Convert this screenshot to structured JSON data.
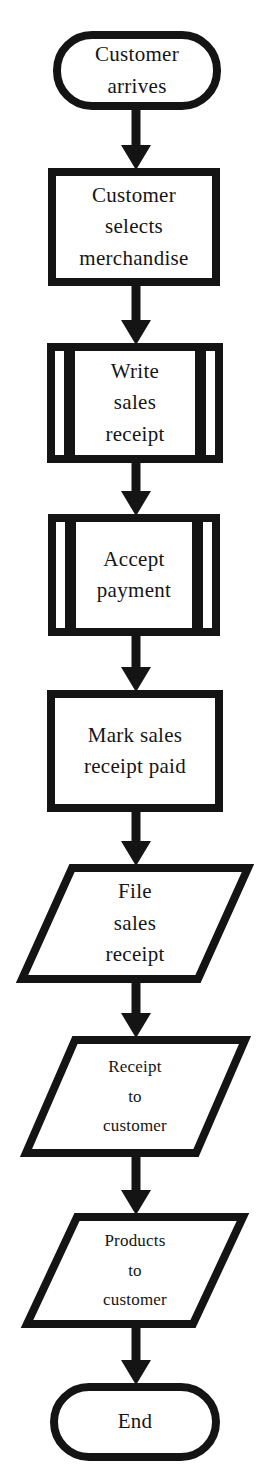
{
  "diagram": {
    "type": "flowchart",
    "orientation": "top-to-bottom",
    "colors": {
      "ink": "#141414",
      "paper": "#ffffff",
      "text": "#151515"
    },
    "nodes": [
      {
        "id": "start",
        "type": "terminal",
        "label": "Customer\narrives"
      },
      {
        "id": "select-merchandise",
        "type": "process",
        "label": "Customer\nselects\nmerchandise"
      },
      {
        "id": "write-sales-receipt",
        "type": "predefined-process",
        "label": "Write\nsales\nreceipt"
      },
      {
        "id": "accept-payment",
        "type": "predefined-process",
        "label": "Accept\npayment"
      },
      {
        "id": "mark-receipt-paid",
        "type": "process",
        "label": "Mark sales\nreceipt paid"
      },
      {
        "id": "file-sales-receipt",
        "type": "input-output",
        "label": "File\nsales\nreceipt"
      },
      {
        "id": "receipt-to-customer",
        "type": "input-output",
        "label": "Receipt\nto\ncustomer"
      },
      {
        "id": "products-to-customer",
        "type": "input-output",
        "label": "Products\nto\ncustomer"
      },
      {
        "id": "end",
        "type": "terminal",
        "label": "End"
      }
    ],
    "edges": [
      {
        "from": "start",
        "to": "select-merchandise"
      },
      {
        "from": "select-merchandise",
        "to": "write-sales-receipt"
      },
      {
        "from": "write-sales-receipt",
        "to": "accept-payment"
      },
      {
        "from": "accept-payment",
        "to": "mark-receipt-paid"
      },
      {
        "from": "mark-receipt-paid",
        "to": "file-sales-receipt"
      },
      {
        "from": "file-sales-receipt",
        "to": "receipt-to-customer"
      },
      {
        "from": "receipt-to-customer",
        "to": "products-to-customer"
      },
      {
        "from": "products-to-customer",
        "to": "end"
      }
    ]
  }
}
